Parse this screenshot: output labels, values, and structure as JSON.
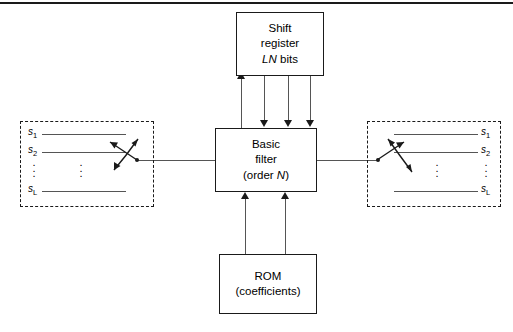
{
  "figure": {
    "title_present": false,
    "background": "#ffffff",
    "line_color": "#1a1a1a"
  },
  "blocks": {
    "shift_register": {
      "line1": "Shift",
      "line2": "register",
      "line3_italic": "LN",
      "line3_rest": " bits",
      "name": "shift-register"
    },
    "basic_filter": {
      "line1": "Basic",
      "line2": "filter",
      "line3_open": "(order ",
      "line3_italic": "N",
      "line3_close": ")",
      "name": "basic-filter"
    },
    "rom": {
      "line1": "ROM",
      "line2": "(coefficients)",
      "name": "rom"
    }
  },
  "commutators": {
    "left": {
      "label": "input-commutator",
      "signals": [
        {
          "base": "s",
          "sub": "1"
        },
        {
          "base": "s",
          "sub": "2"
        },
        {
          "base": "s",
          "sub": "L"
        }
      ],
      "dots": "⋮"
    },
    "right": {
      "label": "output-commutator",
      "signals": [
        {
          "base": "s",
          "sub": "1"
        },
        {
          "base": "s",
          "sub": "2"
        },
        {
          "base": "s",
          "sub": "L"
        }
      ],
      "dots": "⋮"
    }
  },
  "connections": {
    "shift_register_to_filter": {
      "count": 4,
      "directions": [
        "up",
        "down",
        "down",
        "down"
      ]
    },
    "rom_to_filter": {
      "count": 2,
      "directions": [
        "up",
        "up"
      ]
    },
    "left_switch_to_filter": "horizontal",
    "filter_to_right_switch": "horizontal"
  }
}
